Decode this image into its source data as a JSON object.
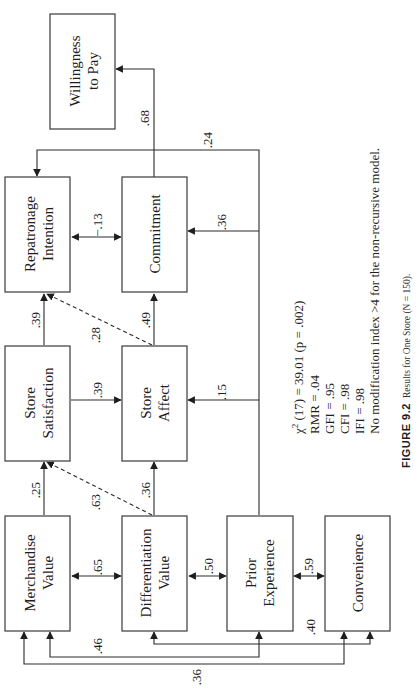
{
  "nodes": {
    "willingness": {
      "line1": "Willingness",
      "line2": "to Pay"
    },
    "repatronage": {
      "line1": "Repatronage",
      "line2": "Intention"
    },
    "commitment": {
      "line1": "Commitment"
    },
    "store_satisfaction": {
      "line1": "Store",
      "line2": "Satisfaction"
    },
    "store_affect": {
      "line1": "Store",
      "line2": "Affect"
    },
    "merchandise": {
      "line1": "Merchandise",
      "line2": "Value"
    },
    "differentiation": {
      "line1": "Differentiation",
      "line2": "Value"
    },
    "prior_experience": {
      "line1": "Prior",
      "line2": "Experience"
    },
    "convenience": {
      "line1": "Convenience"
    }
  },
  "paths": {
    "commitment_to_willingness": ".68",
    "prior_to_repatronage": ".24",
    "repatronage_commitment": "−.13",
    "prior_to_commitment": ".36",
    "satisfaction_to_repatronage": ".39",
    "affect_to_repatronage_dashed": ".28",
    "affect_to_commitment": ".49",
    "satisfaction_to_affect": ".39",
    "prior_to_affect": ".15",
    "merchandise_to_satisfaction": ".25",
    "differentiation_to_satisfaction_dashed": ".63",
    "differentiation_to_affect": ".36",
    "merchandise_differentiation": ".65",
    "differentiation_prior": ".50",
    "prior_convenience": ".59",
    "merchandise_prior": ".46",
    "differentiation_convenience": ".40",
    "merchandise_convenience": ".36"
  },
  "stats": {
    "chi_symbol": "χ",
    "chi_sup": "2",
    "chi_rest": " (17) = 39.01 (p = .002)",
    "rmr": "RMR = .04",
    "gfi": "GFI = .95",
    "cfi": "CFI = .98",
    "ifi": "IFI = .98",
    "note": "No modification index >4 for the non-recursive model."
  },
  "caption": {
    "tag": "FIGURE 9.2",
    "text": "Results for One Store (N = 150)."
  }
}
